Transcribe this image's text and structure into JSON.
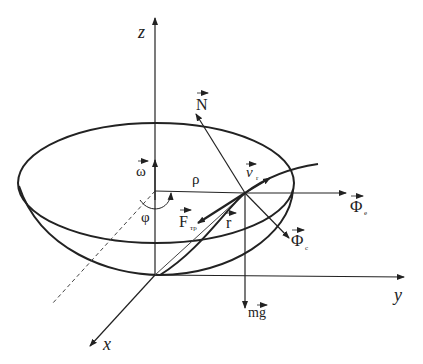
{
  "diagram": {
    "axes": {
      "z": "z",
      "y": "y",
      "x": "x"
    },
    "labels": {
      "omega": "ω",
      "rho": "ρ",
      "phi": "φ",
      "N": "N",
      "v": "v",
      "v_sub": "r",
      "Phi_e": "Φ",
      "Phi_e_sub": "e",
      "Phi_c": "Φ",
      "Phi_c_sub": "c",
      "F": "F",
      "F_sub": "тр",
      "r": "r",
      "mg": "mg"
    },
    "colors": {
      "stroke": "#222222",
      "background": "#ffffff"
    }
  }
}
